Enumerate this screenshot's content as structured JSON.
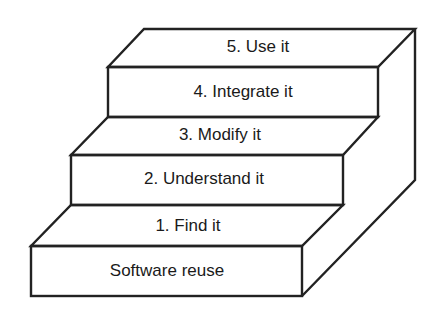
{
  "diagram": {
    "type": "staircase",
    "base_label": "Software reuse",
    "steps": [
      {
        "label": "1. Find it"
      },
      {
        "label": "2. Understand it"
      },
      {
        "label": "3. Modify it"
      },
      {
        "label": "4. Integrate it"
      },
      {
        "label": "5. Use it"
      }
    ],
    "line_color": "#222222",
    "fill_color": "#ffffff"
  }
}
